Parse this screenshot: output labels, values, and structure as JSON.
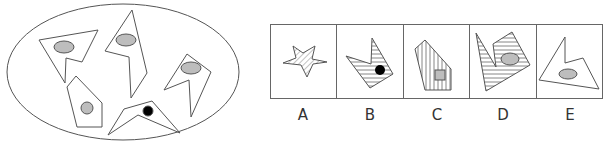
{
  "puzzle": {
    "question_figure": {
      "container": "ellipse",
      "shapes": [
        {
          "type": "concave-polygon",
          "inner_mark": "gray-ellipse"
        },
        {
          "type": "concave-polygon",
          "inner_mark": "gray-ellipse"
        },
        {
          "type": "concave-polygon",
          "inner_mark": "gray-ellipse"
        },
        {
          "type": "pentagon",
          "inner_mark": "gray-circle"
        },
        {
          "type": "concave-polygon",
          "inner_mark": "black-dot"
        }
      ]
    },
    "options": [
      {
        "label": "A",
        "shape": "star",
        "fill": "diagonal-hatch",
        "inner_mark": "none"
      },
      {
        "label": "B",
        "shape": "concave-polygon",
        "fill": "horizontal-hatch",
        "inner_mark": "black-dot"
      },
      {
        "label": "C",
        "shape": "pentagon",
        "fill": "vertical-hatch",
        "inner_mark": "gray-square"
      },
      {
        "label": "D",
        "shape": "concave-polygon",
        "fill": "horizontal-hatch",
        "inner_mark": "gray-ellipse"
      },
      {
        "label": "E",
        "shape": "concave-polygon",
        "fill": "none",
        "inner_mark": "gray-ellipse"
      }
    ],
    "colors": {
      "stroke": "#555555",
      "gray_fill": "#bdbdbd",
      "dot": "#000000",
      "hatch": "#666666"
    }
  }
}
